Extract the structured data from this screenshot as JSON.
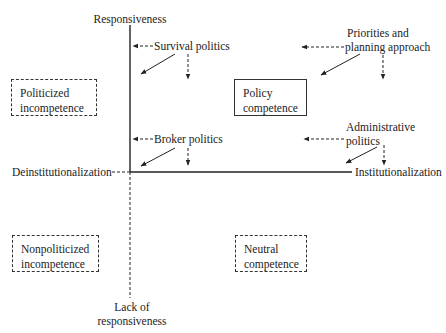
{
  "axes": {
    "top": "Responsiveness",
    "bottom_line1": "Lack of",
    "bottom_line2": "responsiveness",
    "left": "Deinstitutionalization",
    "right": "Institutionalization"
  },
  "quadrants": {
    "top_left": {
      "line1": "Politicized",
      "line2": "incompetence",
      "border": "dashed"
    },
    "top_right": {
      "line1": "Policy",
      "line2": "competence",
      "border": "solid"
    },
    "bottom_left": {
      "line1": "Nonpoliticized",
      "line2": "incompetence",
      "border": "dashed"
    },
    "bottom_right": {
      "line1": "Neutral",
      "line2": "competence",
      "border": "dashed"
    }
  },
  "forces": {
    "survival": "Survival politics",
    "priorities_line1": "Priorities and",
    "priorities_line2": "planning approach",
    "broker": "Broker politics",
    "administrative_line1": "Administrative",
    "administrative_line2": "politics"
  },
  "colors": {
    "ink": "#222222",
    "background": "#ffffff"
  }
}
